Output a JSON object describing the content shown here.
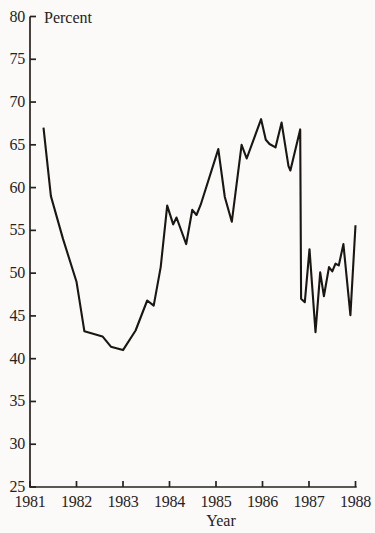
{
  "figure": {
    "background_color": "#fbfaf8",
    "ink_color": "#26221e"
  },
  "chart_data": {
    "type": "line",
    "title": "",
    "ylabel": "Percent",
    "xlabel": "Year",
    "xlim": [
      1981,
      1988
    ],
    "ylim": [
      25,
      80
    ],
    "x_ticks": [
      1981,
      1982,
      1983,
      1984,
      1985,
      1986,
      1987,
      1988
    ],
    "y_ticks": [
      25,
      30,
      35,
      40,
      45,
      50,
      55,
      60,
      65,
      70,
      75,
      80
    ],
    "grid": false,
    "legend_position": "none",
    "series": [
      {
        "name": "percent",
        "color": "#1a1713",
        "points": [
          [
            1981.29,
            67.0
          ],
          [
            1981.45,
            59.0
          ],
          [
            1981.71,
            54.0
          ],
          [
            1982.0,
            49.0
          ],
          [
            1982.17,
            43.2
          ],
          [
            1982.56,
            42.6
          ],
          [
            1982.74,
            41.4
          ],
          [
            1983.0,
            41.0
          ],
          [
            1983.27,
            43.3
          ],
          [
            1983.52,
            46.8
          ],
          [
            1983.66,
            46.2
          ],
          [
            1983.81,
            50.7
          ],
          [
            1983.95,
            57.9
          ],
          [
            1984.08,
            55.7
          ],
          [
            1984.15,
            56.5
          ],
          [
            1984.36,
            53.4
          ],
          [
            1984.49,
            57.4
          ],
          [
            1984.58,
            56.8
          ],
          [
            1984.67,
            58.0
          ],
          [
            1985.05,
            64.5
          ],
          [
            1985.19,
            58.9
          ],
          [
            1985.34,
            56.0
          ],
          [
            1985.55,
            65.0
          ],
          [
            1985.66,
            63.4
          ],
          [
            1985.97,
            68.0
          ],
          [
            1986.07,
            65.6
          ],
          [
            1986.15,
            65.1
          ],
          [
            1986.28,
            64.7
          ],
          [
            1986.41,
            67.6
          ],
          [
            1986.56,
            62.5
          ],
          [
            1986.6,
            62.0
          ],
          [
            1986.81,
            66.8
          ],
          [
            1986.83,
            47.0
          ],
          [
            1986.91,
            46.6
          ],
          [
            1987.01,
            52.8
          ],
          [
            1987.14,
            43.1
          ],
          [
            1987.24,
            50.1
          ],
          [
            1987.32,
            47.3
          ],
          [
            1987.43,
            50.7
          ],
          [
            1987.5,
            50.2
          ],
          [
            1987.57,
            51.1
          ],
          [
            1987.64,
            50.9
          ],
          [
            1987.74,
            53.4
          ],
          [
            1987.89,
            45.1
          ],
          [
            1988.0,
            55.6
          ]
        ]
      }
    ]
  }
}
